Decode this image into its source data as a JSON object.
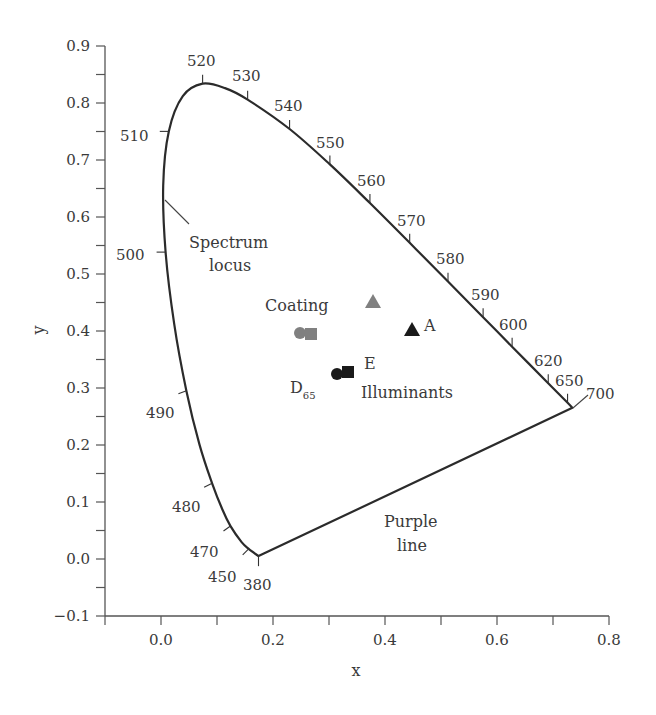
{
  "chart_data": {
    "type": "scatter",
    "title": "",
    "subtitle": "CIE 1931 chromaticity diagram",
    "xlabel": "x",
    "ylabel": "y",
    "xlim": [
      -0.1,
      0.8
    ],
    "ylim": [
      -0.1,
      0.9
    ],
    "grid": false,
    "x_ticks": [
      "0.0",
      "0.2",
      "0.4",
      "0.6",
      "0.8"
    ],
    "x_tick_values": [
      0.0,
      0.2,
      0.4,
      0.6,
      0.8
    ],
    "x_minor_ticks": [
      -0.1,
      0.1,
      0.3,
      0.5,
      0.7
    ],
    "y_ticks": [
      "−0.1",
      "0.0",
      "0.1",
      "0.2",
      "0.3",
      "0.4",
      "0.5",
      "0.6",
      "0.7",
      "0.8",
      "0.9"
    ],
    "y_tick_values": [
      -0.1,
      0.0,
      0.1,
      0.2,
      0.3,
      0.4,
      0.5,
      0.6,
      0.7,
      0.8,
      0.9
    ],
    "spectrum_locus": {
      "name": "Spectrum locus",
      "points": [
        {
          "nm": 380,
          "x": 0.1741,
          "y": 0.005
        },
        {
          "nm": 450,
          "x": 0.1566,
          "y": 0.0177
        },
        {
          "nm": 460,
          "x": 0.144,
          "y": 0.0297
        },
        {
          "nm": 470,
          "x": 0.1241,
          "y": 0.0578
        },
        {
          "nm": 475,
          "x": 0.1096,
          "y": 0.0868
        },
        {
          "nm": 480,
          "x": 0.0913,
          "y": 0.1327
        },
        {
          "nm": 485,
          "x": 0.0687,
          "y": 0.2007
        },
        {
          "nm": 490,
          "x": 0.0454,
          "y": 0.295
        },
        {
          "nm": 495,
          "x": 0.0235,
          "y": 0.4127
        },
        {
          "nm": 500,
          "x": 0.0082,
          "y": 0.5384
        },
        {
          "nm": 505,
          "x": 0.0039,
          "y": 0.6548
        },
        {
          "nm": 510,
          "x": 0.0139,
          "y": 0.7502
        },
        {
          "nm": 515,
          "x": 0.0389,
          "y": 0.812
        },
        {
          "nm": 520,
          "x": 0.0743,
          "y": 0.8338
        },
        {
          "nm": 525,
          "x": 0.1142,
          "y": 0.8262
        },
        {
          "nm": 530,
          "x": 0.1547,
          "y": 0.8059
        },
        {
          "nm": 540,
          "x": 0.2296,
          "y": 0.7543
        },
        {
          "nm": 550,
          "x": 0.3016,
          "y": 0.6923
        },
        {
          "nm": 560,
          "x": 0.3731,
          "y": 0.6245
        },
        {
          "nm": 570,
          "x": 0.4441,
          "y": 0.5547
        },
        {
          "nm": 580,
          "x": 0.5125,
          "y": 0.4866
        },
        {
          "nm": 590,
          "x": 0.5752,
          "y": 0.4242
        },
        {
          "nm": 600,
          "x": 0.627,
          "y": 0.3725
        },
        {
          "nm": 620,
          "x": 0.6915,
          "y": 0.3083
        },
        {
          "nm": 650,
          "x": 0.726,
          "y": 0.274
        },
        {
          "nm": 700,
          "x": 0.7347,
          "y": 0.2653
        }
      ]
    },
    "wavelength_labels": [
      "380",
      "450",
      "470",
      "480",
      "490",
      "500",
      "510",
      "520",
      "530",
      "540",
      "550",
      "560",
      "570",
      "580",
      "590",
      "600",
      "620",
      "650",
      "700"
    ],
    "purple_line": {
      "name": "Purple line",
      "from_nm": 380,
      "to_nm": 700
    },
    "series": [
      {
        "name": "Coating",
        "color": "#808080",
        "points": [
          {
            "marker": "circle",
            "x": 0.25,
            "y": 0.4,
            "label": "Coating under D65"
          },
          {
            "marker": "square",
            "x": 0.27,
            "y": 0.395,
            "label": "Coating under E"
          },
          {
            "marker": "triangle",
            "x": 0.38,
            "y": 0.45,
            "label": "Coating under A"
          }
        ]
      },
      {
        "name": "Illuminants",
        "color": "#1a1a1a",
        "points": [
          {
            "marker": "circle",
            "x": 0.3127,
            "y": 0.329,
            "label": "D65"
          },
          {
            "marker": "square",
            "x": 0.3333,
            "y": 0.3333,
            "label": "E"
          },
          {
            "marker": "triangle",
            "x": 0.4476,
            "y": 0.4074,
            "label": "A"
          }
        ]
      }
    ],
    "annotations": [
      "Spectrum locus",
      "Coating",
      "Illuminants",
      "Purple line",
      "A",
      "E",
      "D65"
    ]
  },
  "labels": {
    "x_axis_title": "x",
    "y_axis_title": "y",
    "spectrum_line1": "Spectrum",
    "spectrum_line2": "locus",
    "coating": "Coating",
    "illuminants": "Illuminants",
    "purple_line1": "Purple",
    "purple_line2": "line",
    "illum_a": "A",
    "illum_e": "E",
    "illum_d": "D",
    "illum_d_sub": "65"
  },
  "colors": {
    "curve": "#2b2b2b",
    "axis": "#555555",
    "coating_marker": "#808080",
    "illuminant_marker": "#1a1a1a"
  }
}
